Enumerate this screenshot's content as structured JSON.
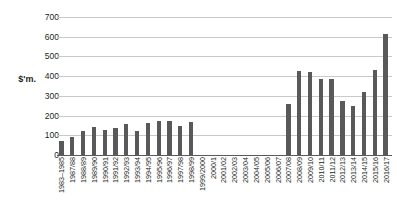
{
  "chart_data": {
    "type": "bar",
    "title": "",
    "xlabel": "",
    "ylabel": "$'m.",
    "ylim": [
      0,
      700
    ],
    "ytick_step": 100,
    "yticks": [
      700,
      600,
      500,
      400,
      300,
      200,
      100,
      0
    ],
    "grid": true,
    "legend": false,
    "bar_color": "#595959",
    "gridline_color": "#c9c9c9",
    "axis_color": "#5a5a5a",
    "categories": [
      "1983–1985",
      "1987/88",
      "1988/89",
      "1989/90",
      "1990/91",
      "1991/92",
      "1992/93",
      "1993/94",
      "1994/95",
      "1995/96",
      "1996/97",
      "1997/98",
      "1998/99",
      "1999/2000",
      "2000/1",
      "2001/02",
      "2002/03",
      "2003/04",
      "2004/05",
      "2005/06",
      "2006/07",
      "2007/08",
      "2008/09",
      "2009/10",
      "2010/11",
      "2011/12",
      "2012/13",
      "2013/14",
      "2014/15",
      "2015/16",
      "2016/17"
    ],
    "values": [
      70,
      92,
      120,
      140,
      128,
      138,
      155,
      122,
      160,
      172,
      172,
      148,
      170,
      null,
      null,
      null,
      null,
      null,
      null,
      null,
      null,
      260,
      425,
      420,
      385,
      385,
      275,
      250,
      320,
      430,
      615
    ]
  }
}
